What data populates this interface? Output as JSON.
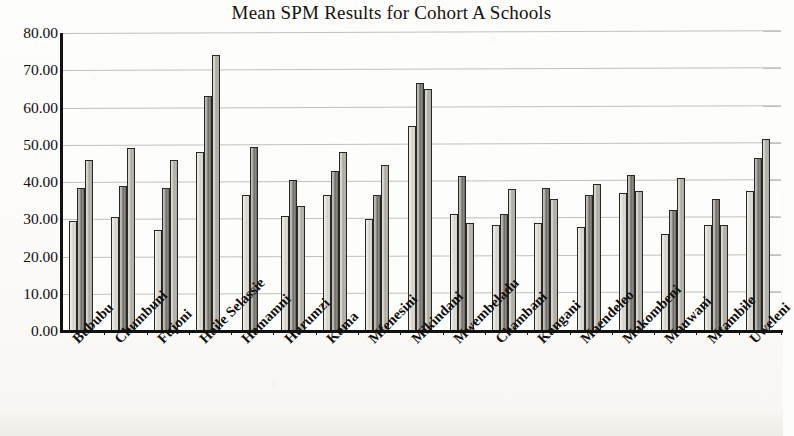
{
  "chart_data": {
    "type": "bar",
    "title": "Mean SPM Results for Cohort A Schools",
    "xlabel": "",
    "ylabel": "",
    "ylim": [
      0,
      80
    ],
    "ytick_labels": [
      "80.00",
      "70.00",
      "60.00",
      "50.00",
      "40.00",
      "30.00",
      "20.00",
      "10.00",
      "0.00"
    ],
    "ytick_values": [
      80,
      70,
      60,
      50,
      40,
      30,
      20,
      10,
      0
    ],
    "ytick_step": 10,
    "grid": true,
    "legend": null,
    "legend_position": "none",
    "categories": [
      "Bububu",
      "Chumbuni",
      "Fujoni",
      "Haile Selassie",
      "Hamamni",
      "Hurumzi",
      "Kama",
      "Mfenesini",
      "Mikindani",
      "Mwembeladu",
      "Chambani",
      "Kangani",
      "Maendeleo",
      "Makombeni",
      "Mauwani",
      "Mtambile",
      "Uweleni"
    ],
    "series": [
      {
        "name": "Series 1",
        "color": "#dedbd4",
        "values": [
          29.5,
          30.5,
          27.0,
          48.0,
          36.5,
          31.0,
          36.5,
          30.0,
          55.0,
          31.5,
          28.5,
          29.0,
          28.0,
          37.0,
          26.0,
          28.5,
          37.5
        ]
      },
      {
        "name": "Series 2",
        "color": "#74716a",
        "values": [
          38.5,
          39.0,
          38.5,
          63.0,
          49.5,
          40.5,
          43.0,
          36.5,
          66.5,
          41.5,
          31.5,
          38.5,
          36.5,
          42.0,
          32.5,
          35.5,
          46.5
        ]
      },
      {
        "name": "Series 3",
        "color": "#b9b6ae",
        "values": [
          46.0,
          49.0,
          46.0,
          74.0,
          null,
          33.5,
          48.0,
          44.5,
          65.0,
          29.0,
          38.0,
          35.5,
          39.5,
          37.5,
          41.0,
          28.5,
          51.5
        ]
      }
    ]
  }
}
